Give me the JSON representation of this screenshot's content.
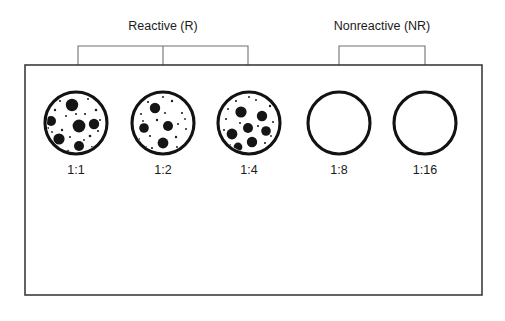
{
  "figure": {
    "title_alt": "Agglutination titration tray diagram",
    "background_color": "#ffffff",
    "width": 505,
    "height": 321
  },
  "brackets": [
    {
      "id": "reactive",
      "label": "Reactive (R)",
      "label_x": 163,
      "label_y": 30,
      "bar_y": 46,
      "x_start": 78,
      "x_end": 248,
      "ticks": [
        78,
        163,
        248
      ],
      "drop_to_y": 100,
      "covers": [
        "1:1",
        "1:2",
        "1:4"
      ]
    },
    {
      "id": "nonreactive",
      "label": "Nonreactive (NR)",
      "label_x": 382,
      "label_y": 30,
      "bar_y": 46,
      "x_start": 339,
      "x_end": 425,
      "ticks": [
        339,
        425
      ],
      "drop_to_y": 100,
      "covers": [
        "1:8",
        "1:16"
      ]
    }
  ],
  "tray": {
    "x": 25,
    "y": 65,
    "width": 457,
    "height": 230,
    "border_color": "#3a3c3f"
  },
  "wells": [
    {
      "label": "1:1",
      "cx": 76,
      "cy": 123,
      "r": 31,
      "result": "reactive",
      "agglutination": true,
      "clump_count": 6,
      "clumps": [
        {
          "x": 72,
          "y": 105,
          "r": 6.2
        },
        {
          "x": 51,
          "y": 121,
          "r": 5.0
        },
        {
          "x": 79,
          "y": 126,
          "r": 6.4
        },
        {
          "x": 94,
          "y": 124,
          "r": 5.2
        },
        {
          "x": 59,
          "y": 139,
          "r": 5.6
        },
        {
          "x": 79,
          "y": 146,
          "r": 5.0
        }
      ]
    },
    {
      "label": "1:2",
      "cx": 163,
      "cy": 123,
      "r": 31,
      "result": "reactive",
      "agglutination": true,
      "clump_count": 4,
      "clumps": [
        {
          "x": 155,
          "y": 108,
          "r": 5.2
        },
        {
          "x": 144,
          "y": 128,
          "r": 4.8
        },
        {
          "x": 168,
          "y": 126,
          "r": 5.0
        },
        {
          "x": 163,
          "y": 143,
          "r": 5.4
        }
      ]
    },
    {
      "label": "1:4",
      "cx": 249,
      "cy": 123,
      "r": 31,
      "result": "reactive",
      "agglutination": true,
      "clump_count": 7,
      "clumps": [
        {
          "x": 241,
          "y": 112,
          "r": 5.6
        },
        {
          "x": 262,
          "y": 116,
          "r": 5.2
        },
        {
          "x": 248,
          "y": 128,
          "r": 5.0
        },
        {
          "x": 266,
          "y": 131,
          "r": 4.8
        },
        {
          "x": 232,
          "y": 134,
          "r": 5.4
        },
        {
          "x": 252,
          "y": 142,
          "r": 5.2
        },
        {
          "x": 238,
          "y": 147,
          "r": 4.4
        }
      ]
    },
    {
      "label": "1:8",
      "cx": 339,
      "cy": 123,
      "r": 31,
      "result": "nonreactive",
      "agglutination": false,
      "clump_count": 0,
      "clumps": []
    },
    {
      "label": "1:16",
      "cx": 425,
      "cy": 123,
      "r": 31,
      "result": "nonreactive",
      "agglutination": false,
      "clump_count": 0,
      "clumps": []
    }
  ],
  "well_label_y": 174,
  "colors": {
    "well_outline": "#121212",
    "clump": "#151515",
    "bracket": "#6e7073",
    "tray_border": "#3a3c3f",
    "text": "#1b1b1b"
  }
}
